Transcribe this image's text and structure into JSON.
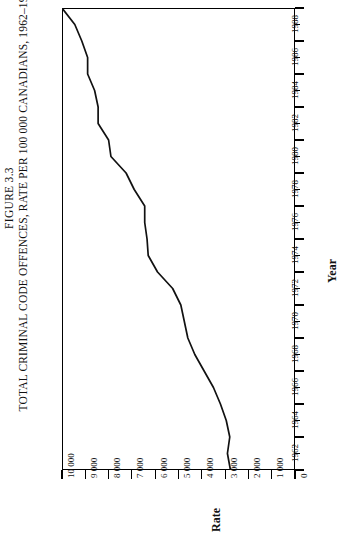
{
  "figure": {
    "number_label": "FIGURE 3.3",
    "caption": "TOTAL CRIMINAL CODE OFFENCES, RATE PER 100 000 CANADIANS, 1962–1990"
  },
  "axes": {
    "rate_axis_title": "Rate",
    "year_axis_title": "Year",
    "rate_ticks": [
      "10 000",
      "9 000",
      "8 000",
      "7 000",
      "6 000",
      "5 000",
      "4 000",
      "3 000",
      "2 000",
      "1 000",
      "0"
    ],
    "year_ticks": [
      "1962",
      "1964",
      "1966",
      "1968",
      "1970",
      "1972",
      "1974",
      "1976",
      "1978",
      "1980",
      "1982",
      "1984",
      "1986",
      "1988",
      "1990"
    ]
  },
  "style": {
    "line_color": "#111111",
    "frame_color": "#000000",
    "background": "#ffffff"
  },
  "chart_data": {
    "type": "line",
    "title": "TOTAL CRIMINAL CODE OFFENCES, RATE PER 100 000 CANADIANS, 1962–1990",
    "orientation": "rotated-90",
    "xlabel": "Year",
    "ylabel": "Rate",
    "xlim": [
      1962,
      1990
    ],
    "ylim": [
      0,
      10000
    ],
    "grid": false,
    "legend": null,
    "x": [
      1962,
      1963,
      1964,
      1965,
      1966,
      1967,
      1968,
      1969,
      1970,
      1971,
      1972,
      1973,
      1974,
      1975,
      1976,
      1977,
      1978,
      1979,
      1980,
      1981,
      1982,
      1983,
      1984,
      1985,
      1986,
      1987,
      1988,
      1989,
      1990
    ],
    "series": [
      {
        "name": "Total Criminal Code offences rate per 100 000",
        "values": [
          2771,
          2900,
          2800,
          2950,
          3200,
          3500,
          3900,
          4300,
          4600,
          4750,
          4900,
          5250,
          5900,
          6300,
          6350,
          6450,
          6450,
          6900,
          7250,
          7900,
          8000,
          8450,
          8450,
          8600,
          8900,
          8900,
          9150,
          9450,
          10000
        ]
      }
    ]
  }
}
